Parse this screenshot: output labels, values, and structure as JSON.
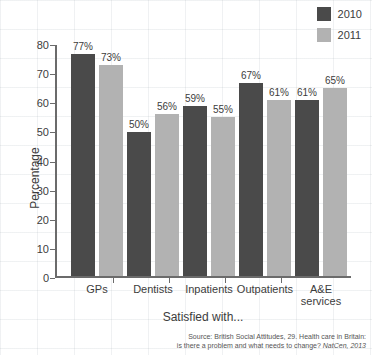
{
  "chart_data": {
    "type": "bar",
    "title": "",
    "xlabel": "Satisfied with...",
    "ylabel": "Percentage",
    "ylim": [
      0,
      80
    ],
    "yticks": [
      0,
      10,
      20,
      30,
      40,
      50,
      60,
      70,
      80
    ],
    "grid": true,
    "legend_position": "top-right",
    "categories": [
      "GPs",
      "Dentists",
      "Inpatients",
      "Outpatients",
      "A&E services"
    ],
    "series": [
      {
        "name": "2010",
        "color": "#4a4a4a",
        "values": [
          77,
          73,
          50,
          59,
          67
        ],
        "values_ordered_by_category": [
          77,
          50,
          59,
          67,
          61
        ]
      },
      {
        "name": "2011",
        "color": "#b2b2b2",
        "values": [
          73,
          56,
          55,
          61,
          65
        ],
        "values_ordered_by_category": [
          73,
          56,
          55,
          61,
          65
        ]
      }
    ],
    "bars": [
      {
        "category": "GPs",
        "y2010": 77,
        "y2011": 73,
        "label_2010": "77%",
        "label_2011": "73%"
      },
      {
        "category": "Dentists",
        "y2010": 50,
        "y2011": 56,
        "label_2010": "50%",
        "label_2011": "56%"
      },
      {
        "category": "Inpatients",
        "y2010": 59,
        "y2011": 55,
        "label_2010": "59%",
        "label_2011": "55%"
      },
      {
        "category": "Outpatients",
        "y2010": 67,
        "y2011": 61,
        "label_2010": "67%",
        "label_2011": "61%"
      },
      {
        "category": "A&E services",
        "y2010": 61,
        "y2011": 65,
        "label_2010": "61%",
        "label_2011": "65%"
      }
    ],
    "annotations": {
      "source_line_1": "Source: British Social Attitudes, 29. Health care in Britain:",
      "source_line_2_plain": "is there a problem and what needs to change? ",
      "source_line_2_italic": "NatCen, 2013"
    }
  },
  "legend": {
    "items": [
      {
        "label": "2010",
        "color": "#4a4a4a"
      },
      {
        "label": "2011",
        "color": "#b2b2b2"
      }
    ]
  },
  "axes": {
    "y_title": "Percentage",
    "x_title": "Satisfied with...",
    "y_tick_labels": [
      "0",
      "10",
      "20",
      "30",
      "40",
      "50",
      "60",
      "70",
      "80"
    ]
  },
  "category_labels": [
    {
      "line1": "GPs",
      "line2": ""
    },
    {
      "line1": "Dentists",
      "line2": ""
    },
    {
      "line1": "Inpatients",
      "line2": ""
    },
    {
      "line1": "Outpatients",
      "line2": ""
    },
    {
      "line1": "A&E",
      "line2": "services"
    }
  ],
  "source": {
    "line1": "Source: British Social Attitudes, 29. Health care in Britain:",
    "line2_plain": "is there a problem and what needs to change? ",
    "line2_italic": "NatCen, 2013"
  }
}
